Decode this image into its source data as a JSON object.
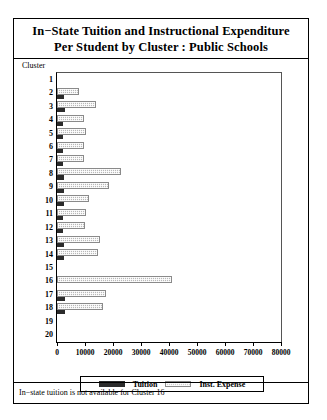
{
  "title": {
    "line1": "In−State Tuition and Instructional Expenditure",
    "line2": "Per Student by Cluster : Public Schools"
  },
  "axis_caption": "Cluster",
  "footnote": "In−state tuition is not available for Cluster 16",
  "legend": {
    "tuition_label": "Tuition",
    "expense_label": "Inst. Expense"
  },
  "colors": {
    "tuition": "#2b2b2b",
    "expense": "#b9b9b9",
    "frame": "#000000"
  },
  "chart_data": {
    "type": "bar",
    "orientation": "horizontal",
    "grouped": true,
    "title": "In−State Tuition and Instructional Expenditure Per Student by Cluster : Public Schools",
    "xlabel": "",
    "ylabel": "Cluster",
    "xlim": [
      0,
      80000
    ],
    "xticks": [
      0,
      10000,
      20000,
      30000,
      40000,
      50000,
      60000,
      70000,
      80000
    ],
    "xticklabels": [
      "0",
      "10000",
      "20000",
      "30000",
      "40000",
      "50000",
      "60000",
      "70000",
      "80000"
    ],
    "grid": false,
    "legend_position": "bottom",
    "categories": [
      "1",
      "2",
      "3",
      "4",
      "5",
      "6",
      "7",
      "8",
      "9",
      "10",
      "11",
      "12",
      "13",
      "14",
      "15",
      "16",
      "17",
      "18",
      "19",
      "20"
    ],
    "series": [
      {
        "name": "Tuition",
        "values": [
          0,
          2400,
          2700,
          2300,
          2300,
          2300,
          2300,
          2400,
          2500,
          2400,
          2300,
          2300,
          2500,
          2600,
          0,
          0,
          2700,
          2900,
          0,
          0
        ]
      },
      {
        "name": "Inst. Expense",
        "values": [
          0,
          8000,
          14000,
          9500,
          10500,
          9800,
          9800,
          23000,
          18500,
          11500,
          10500,
          10000,
          15500,
          14500,
          0,
          41000,
          17500,
          16500,
          0,
          0
        ]
      }
    ],
    "notes": "In−state tuition is not available for Cluster 16"
  }
}
